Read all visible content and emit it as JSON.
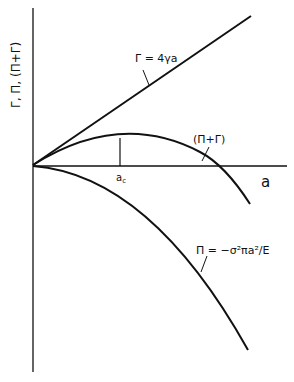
{
  "diagram": {
    "y_axis_label": "Γ, Π, (Π+Γ)",
    "x_axis_label": "a",
    "critical_marker": "a",
    "critical_marker_sub": "c",
    "curves": {
      "gamma": {
        "label": "Γ = 4γa"
      },
      "sum": {
        "label": "(Π+Γ)"
      },
      "pi": {
        "label": "Π = −σ²πa²/E"
      }
    },
    "colors": {
      "line": "#111111",
      "background": "#ffffff"
    }
  }
}
